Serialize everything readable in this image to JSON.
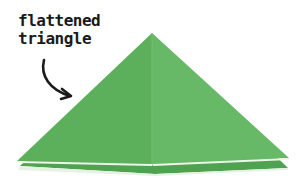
{
  "annotation": {
    "line1": "flattened",
    "line2": "triangle"
  },
  "colors": {
    "paper_green": "#5fb25f",
    "paper_green_right": "#66b766",
    "paper_edge": "#e6f3e0",
    "arrow": "#1a1a1a"
  }
}
